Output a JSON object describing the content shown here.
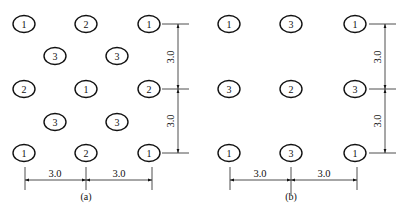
{
  "diagrams": [
    {
      "id": "a",
      "caption": "(a)",
      "nodes": [
        {
          "x": 24,
          "y": 24,
          "label": "1"
        },
        {
          "x": 86,
          "y": 24,
          "label": "2"
        },
        {
          "x": 149,
          "y": 24,
          "label": "1"
        },
        {
          "x": 55,
          "y": 56,
          "label": "3"
        },
        {
          "x": 117,
          "y": 56,
          "label": "3"
        },
        {
          "x": 24,
          "y": 89,
          "label": "2"
        },
        {
          "x": 86,
          "y": 89,
          "label": "1"
        },
        {
          "x": 149,
          "y": 89,
          "label": "2"
        },
        {
          "x": 55,
          "y": 122,
          "label": "3"
        },
        {
          "x": 117,
          "y": 122,
          "label": "3"
        },
        {
          "x": 24,
          "y": 153,
          "label": "1"
        },
        {
          "x": 86,
          "y": 153,
          "label": "2"
        },
        {
          "x": 149,
          "y": 153,
          "label": "1"
        }
      ],
      "vertical_dims": [
        "3.0",
        "3.0"
      ],
      "horizontal_dims": [
        "3.0",
        "3.0"
      ]
    },
    {
      "id": "b",
      "caption": "(b)",
      "nodes": [
        {
          "x": 229,
          "y": 24,
          "label": "1"
        },
        {
          "x": 291,
          "y": 24,
          "label": "3"
        },
        {
          "x": 355,
          "y": 24,
          "label": "1"
        },
        {
          "x": 229,
          "y": 89,
          "label": "3"
        },
        {
          "x": 291,
          "y": 89,
          "label": "2"
        },
        {
          "x": 355,
          "y": 89,
          "label": "3"
        },
        {
          "x": 229,
          "y": 153,
          "label": "1"
        },
        {
          "x": 291,
          "y": 153,
          "label": "3"
        },
        {
          "x": 355,
          "y": 153,
          "label": "1"
        }
      ],
      "vertical_dims": [
        "3.0",
        "3.0"
      ],
      "horizontal_dims": [
        "3.0",
        "3.0"
      ]
    }
  ]
}
